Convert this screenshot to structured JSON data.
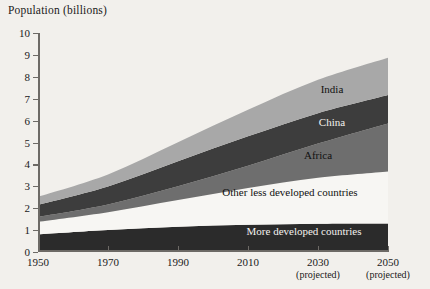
{
  "chart": {
    "axis_title": "Population (billions)",
    "y_ticks": [
      0,
      1,
      2,
      3,
      4,
      5,
      6,
      7,
      8,
      9,
      10
    ],
    "x_ticks": [
      {
        "label": "1950",
        "sub": ""
      },
      {
        "label": "1970",
        "sub": ""
      },
      {
        "label": "1990",
        "sub": ""
      },
      {
        "label": "2010",
        "sub": ""
      },
      {
        "label": "2030",
        "sub": "(projected)"
      },
      {
        "label": "2050",
        "sub": "(projected)"
      }
    ],
    "labels": {
      "india": "India",
      "china": "China",
      "africa": "Africa",
      "other_less": "Other less developed countries",
      "more_dev": "More developed countries"
    },
    "colors": {
      "more_developed": "#2b2b2b",
      "other_less_developed": "#f7f6f3",
      "africa": "#6e6e6e",
      "china": "#3d3d3d",
      "india": "#a8a8a8",
      "axis": "#6d6a66",
      "background": "#f2f0ec"
    }
  },
  "chart_data": {
    "type": "area",
    "title": "Population (billions)",
    "xlabel": "",
    "ylabel": "Population (billions)",
    "xlim": [
      1950,
      2050
    ],
    "ylim": [
      0,
      10
    ],
    "grid": false,
    "legend": "in-plot band labels",
    "stacked": true,
    "x": [
      1950,
      1970,
      1990,
      2010,
      2030,
      2050
    ],
    "series": [
      {
        "name": "More developed countries",
        "values": [
          0.81,
          1.01,
          1.15,
          1.24,
          1.29,
          1.3
        ]
      },
      {
        "name": "Other less developed countries",
        "values": [
          0.56,
          0.8,
          1.22,
          1.68,
          2.1,
          2.38
        ]
      },
      {
        "name": "Africa",
        "values": [
          0.23,
          0.36,
          0.63,
          1.02,
          1.56,
          2.19
        ]
      },
      {
        "name": "China",
        "values": [
          0.55,
          0.82,
          1.14,
          1.34,
          1.39,
          1.3
        ]
      },
      {
        "name": "India",
        "values": [
          0.37,
          0.55,
          0.87,
          1.21,
          1.52,
          1.7
        ]
      }
    ],
    "totals": [
      2.52,
      3.54,
      5.01,
      6.49,
      7.86,
      8.87
    ],
    "annotations": [
      {
        "text": "India",
        "x": 2034,
        "y": 7.45
      },
      {
        "text": "China",
        "x": 2034,
        "y": 5.95
      },
      {
        "text": "Africa",
        "x": 2030,
        "y": 4.45
      },
      {
        "text": "Other less developed countries",
        "x": 2022,
        "y": 2.75
      },
      {
        "text": "More developed countries",
        "x": 2026,
        "y": 0.95
      }
    ],
    "projected_from": 2010
  }
}
